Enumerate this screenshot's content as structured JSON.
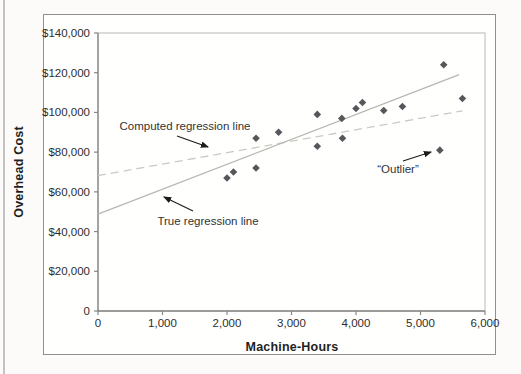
{
  "figure": {
    "x_axis_title": "Machine-Hours",
    "y_axis_title": "Overhead Cost"
  },
  "chart_data": {
    "type": "scatter",
    "title": "",
    "xlabel": "Machine-Hours",
    "ylabel": "Overhead Cost",
    "xlim": [
      0,
      6000
    ],
    "ylim": [
      0,
      140000
    ],
    "grid": false,
    "x_ticks": [
      {
        "value": 0,
        "label": "0"
      },
      {
        "value": 1000,
        "label": "1,000"
      },
      {
        "value": 2000,
        "label": "2,000"
      },
      {
        "value": 3000,
        "label": "3,000"
      },
      {
        "value": 4000,
        "label": "4,000"
      },
      {
        "value": 5000,
        "label": "5,000"
      },
      {
        "value": 6000,
        "label": "6,000"
      }
    ],
    "y_ticks": [
      {
        "value": 0,
        "label": "0"
      },
      {
        "value": 20000,
        "label": "$20,000"
      },
      {
        "value": 40000,
        "label": "$40,000"
      },
      {
        "value": 60000,
        "label": "$60,000"
      },
      {
        "value": 80000,
        "label": "$80,000"
      },
      {
        "value": 100000,
        "label": "$100,000"
      },
      {
        "value": 120000,
        "label": "$120,000"
      },
      {
        "value": 140000,
        "label": "$140,000"
      }
    ],
    "points": [
      {
        "x": 2000,
        "y": 67000
      },
      {
        "x": 2100,
        "y": 70000
      },
      {
        "x": 2450,
        "y": 72000
      },
      {
        "x": 2450,
        "y": 87000
      },
      {
        "x": 2800,
        "y": 90000
      },
      {
        "x": 3400,
        "y": 99000
      },
      {
        "x": 3400,
        "y": 83000
      },
      {
        "x": 3780,
        "y": 97000
      },
      {
        "x": 3790,
        "y": 87000
      },
      {
        "x": 4000,
        "y": 102000
      },
      {
        "x": 4100,
        "y": 105000
      },
      {
        "x": 4430,
        "y": 101000
      },
      {
        "x": 4720,
        "y": 103000
      },
      {
        "x": 5360,
        "y": 124000
      },
      {
        "x": 5650,
        "y": 107000
      }
    ],
    "outlier_point": {
      "x": 5300,
      "y": 81000
    },
    "lines": [
      {
        "name": "Computed regression line",
        "style": "dashed",
        "x1": 0,
        "y1": 68200,
        "x2": 5650,
        "y2": 100800,
        "color": "#c9cbc2"
      },
      {
        "name": "True regression line",
        "style": "solid",
        "x1": 0,
        "y1": 48800,
        "x2": 5600,
        "y2": 119000,
        "color": "#b5b8ae"
      }
    ],
    "annotations": [
      {
        "id": "computed",
        "text": "Computed regression line",
        "text_x": 185,
        "text_y": 130,
        "arrow": [
          177,
          136,
          208,
          147
        ]
      },
      {
        "id": "true",
        "text": "True regression line",
        "text_x": 208,
        "text_y": 225,
        "arrow": [
          193,
          211,
          164,
          197
        ]
      },
      {
        "id": "outlier",
        "text": "“Outlier”",
        "text_x": 398,
        "text_y": 173,
        "arrow": [
          403,
          161,
          431,
          152
        ]
      }
    ],
    "colors": {
      "point": "#56575b",
      "axis": "#878787",
      "plot_border": "#b8b8b8",
      "annotation_arrow": "#1c1c1c"
    }
  }
}
